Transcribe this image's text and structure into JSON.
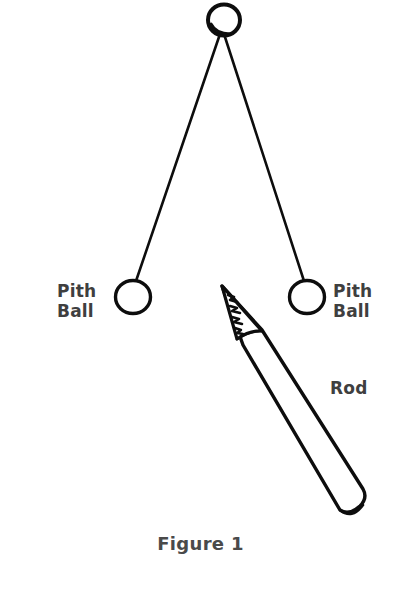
{
  "figure": {
    "caption": "Figure 1",
    "background_color": "#ffffff",
    "ink_color": "#0d0d0d",
    "label_color": "#3f3f3f",
    "labels": {
      "pith_ball_left": {
        "line1": "Pith",
        "line2": "Ball"
      },
      "pith_ball_right": {
        "line1": "Pith",
        "line2": "Ball"
      },
      "rod": "Rod"
    },
    "elements": {
      "anchor_knot": "circle at top where both strings are tied",
      "string_left": "line from anchor down-left to left pith ball",
      "string_right": "line from anchor down-right to right pith ball",
      "pith_ball_left": "small open circle hanging on left string",
      "pith_ball_right": "small open circle hanging on right string",
      "rod": "sharpened pencil-like rod pointing up-left, rounded butt end at lower right"
    }
  }
}
